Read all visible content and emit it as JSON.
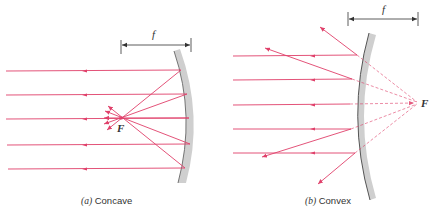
{
  "colors": {
    "ray": "#e0406a",
    "mirror": "#c8c8c8",
    "mirror_edge": "#555555",
    "dim_line": "#333333",
    "text": "#333333"
  },
  "concave": {
    "caption_prefix": "(a)",
    "caption_text": "Concave",
    "focal_label": "F",
    "dimension_label": "f"
  },
  "convex": {
    "caption_prefix": "(b)",
    "caption_text": "Convex",
    "focal_label": "F",
    "dimension_label": "f"
  }
}
